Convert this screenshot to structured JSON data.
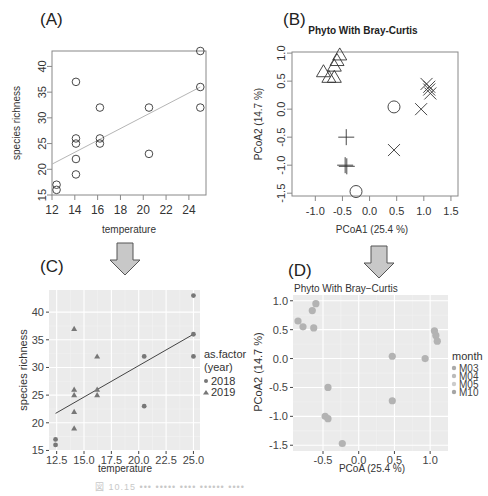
{
  "chart_data": [
    {
      "panel": "(A)",
      "type": "scatter",
      "title": "",
      "xlabel": "temperature",
      "ylabel": "species richness",
      "xlim": [
        12,
        25.5
      ],
      "ylim": [
        15,
        43
      ],
      "xticks": [
        12,
        14,
        16,
        18,
        20,
        22,
        24
      ],
      "yticks": [
        15,
        20,
        25,
        30,
        35,
        40
      ],
      "marker": "open-circle",
      "points": [
        [
          12.4,
          17
        ],
        [
          12.4,
          16
        ],
        [
          14.1,
          37
        ],
        [
          14.1,
          26
        ],
        [
          14.1,
          25
        ],
        [
          14.1,
          22
        ],
        [
          14.1,
          19
        ],
        [
          16.2,
          32
        ],
        [
          16.2,
          26
        ],
        [
          16.2,
          25
        ],
        [
          20.5,
          32
        ],
        [
          20.5,
          23
        ],
        [
          25,
          43
        ],
        [
          25,
          36
        ],
        [
          25,
          32
        ]
      ],
      "regression_line": [
        [
          12,
          21
        ],
        [
          25,
          36
        ]
      ],
      "grid": false
    },
    {
      "panel": "(B)",
      "type": "scatter",
      "title": "Phyto With Bray-Curtis",
      "xlabel": "PCoA1 (25.4 %)",
      "ylabel": "PCoA2 (14.7 %)",
      "xlim": [
        -1.43,
        1.63
      ],
      "ylim": [
        -1.55,
        1.02
      ],
      "xticks": [
        -1.0,
        -0.5,
        0.0,
        0.5,
        1.0,
        1.5
      ],
      "yticks": [
        1.0,
        0.5,
        0.0,
        -0.5,
        -1.0,
        -1.5
      ],
      "series": [
        {
          "name": "triangle",
          "points": [
            [
              -0.85,
              0.65
            ],
            [
              -0.75,
              0.55
            ],
            [
              -0.65,
              0.55
            ],
            [
              -0.6,
              0.85
            ],
            [
              -0.55,
              0.95
            ],
            [
              -0.65,
              0.75
            ]
          ]
        },
        {
          "name": "circle",
          "points": [
            [
              0.45,
              0.04
            ],
            [
              -0.25,
              -1.47
            ]
          ]
        },
        {
          "name": "cross-x",
          "points": [
            [
              1.05,
              0.45
            ],
            [
              1.1,
              0.4
            ],
            [
              1.1,
              0.35
            ],
            [
              1.12,
              0.28
            ],
            [
              0.95,
              0.0
            ],
            [
              0.45,
              -0.73
            ]
          ]
        },
        {
          "name": "plus",
          "points": [
            [
              -0.43,
              -0.5
            ],
            [
              -0.45,
              -1.0
            ],
            [
              -0.42,
              -1.02
            ]
          ]
        }
      ],
      "grid": false
    },
    {
      "panel": "(C)",
      "type": "scatter",
      "title": "",
      "xlabel": "temperature",
      "ylabel": "species richness",
      "xlim": [
        11.8,
        25.6
      ],
      "ylim": [
        14.9,
        44
      ],
      "xticks": [
        12.5,
        15.0,
        17.5,
        20.0,
        22.5,
        25.0
      ],
      "yticks": [
        15,
        20,
        25,
        30,
        35,
        40
      ],
      "legend": {
        "title": "as.factor\n(year)",
        "entries": [
          "2018",
          "2019"
        ],
        "position": "right"
      },
      "series": [
        {
          "name": "2018",
          "marker": "circle",
          "points": [
            [
              12.4,
              17
            ],
            [
              12.4,
              16
            ],
            [
              20.5,
              32
            ],
            [
              20.5,
              23
            ],
            [
              25,
              43
            ],
            [
              25,
              36
            ],
            [
              25,
              32
            ]
          ]
        },
        {
          "name": "2019",
          "marker": "triangle",
          "points": [
            [
              14.1,
              37
            ],
            [
              14.1,
              26
            ],
            [
              14.1,
              25
            ],
            [
              14.1,
              22
            ],
            [
              14.1,
              19
            ],
            [
              16.2,
              32
            ],
            [
              16.2,
              26
            ],
            [
              16.2,
              25
            ]
          ]
        }
      ],
      "regression_line": [
        [
          12.4,
          21.7
        ],
        [
          25,
          36
        ]
      ],
      "grid": true
    },
    {
      "panel": "(D)",
      "type": "scatter",
      "title": "Phyto With Bray−Curtis",
      "xlabel": "PCoA (25.4 %)",
      "ylabel": "PCoA2 (14.7 %)",
      "xlim": [
        -0.92,
        1.25
      ],
      "ylim": [
        -1.6,
        1.1
      ],
      "xticks": [
        -0.5,
        0.0,
        0.5,
        1.0
      ],
      "yticks": [
        1.0,
        0.5,
        0.0,
        -0.5,
        -1.0,
        -1.5
      ],
      "legend": {
        "title": "month",
        "entries": [
          "M03",
          "M04",
          "M05",
          "M10"
        ],
        "position": "right"
      },
      "points": [
        [
          -0.85,
          0.65
        ],
        [
          -0.78,
          0.55
        ],
        [
          -0.65,
          0.83
        ],
        [
          -0.6,
          0.95
        ],
        [
          -0.63,
          0.53
        ],
        [
          1.06,
          0.48
        ],
        [
          1.08,
          0.4
        ],
        [
          1.1,
          0.3
        ],
        [
          0.93,
          0.0
        ],
        [
          0.47,
          0.04
        ],
        [
          0.47,
          -0.73
        ],
        [
          -0.43,
          -0.5
        ],
        [
          -0.47,
          -1.0
        ],
        [
          -0.43,
          -1.04
        ],
        [
          -0.23,
          -1.47
        ]
      ],
      "grid": true
    }
  ],
  "labels": {
    "panel_a": "(A)",
    "panel_b": "(B)",
    "panel_c": "(C)",
    "panel_d": "(D)"
  },
  "caption": "図 10.15 ••• ••••• •••• •••••• ••••"
}
